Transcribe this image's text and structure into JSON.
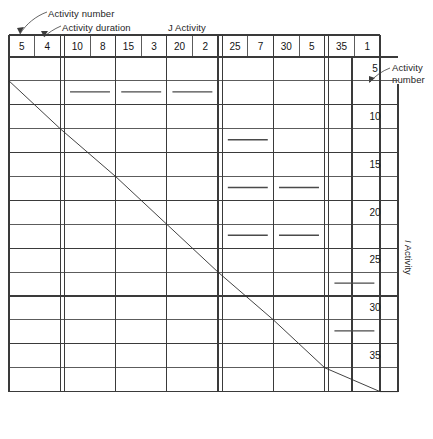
{
  "figure": {
    "type": "precedence-matrix",
    "kind": "activity-on-arrow dependency matrix"
  },
  "annotations": {
    "activity_number_top": "Activity number",
    "activity_duration_top": "Activity duration",
    "j_activity_axis": "J Activity",
    "j_activity_axis_italic": "J",
    "j_activity_axis_rest": " Activity",
    "activity_number_right_line1": "Activity",
    "activity_number_right_line2": "number",
    "i_activity_axis_italic": "I",
    "i_activity_axis_rest": " Activity"
  },
  "columns": {
    "header_label_number": "Activity number",
    "header_label_duration": "Activity duration",
    "items": [
      {
        "number": "5",
        "duration": "4"
      },
      {
        "number": "10",
        "duration": "8"
      },
      {
        "number": "15",
        "duration": "3"
      },
      {
        "number": "20",
        "duration": "2"
      },
      {
        "number": "25",
        "duration": "7"
      },
      {
        "number": "30",
        "duration": "5"
      },
      {
        "number": "35",
        "duration": "1"
      }
    ]
  },
  "rows": {
    "items": [
      {
        "number": "5"
      },
      {
        "number": "10"
      },
      {
        "number": "15"
      },
      {
        "number": "20"
      },
      {
        "number": "25"
      },
      {
        "number": "30"
      },
      {
        "number": "35"
      }
    ]
  },
  "matrix": {
    "mark_glyph": "—",
    "marks": [
      {
        "i": "5",
        "j": "10"
      },
      {
        "i": "5",
        "j": "15"
      },
      {
        "i": "5",
        "j": "20"
      },
      {
        "i": "10",
        "j": "25"
      },
      {
        "i": "15",
        "j": "25"
      },
      {
        "i": "15",
        "j": "30"
      },
      {
        "i": "20",
        "j": "25"
      },
      {
        "i": "20",
        "j": "30"
      },
      {
        "i": "25",
        "j": "35"
      },
      {
        "i": "30",
        "j": "35"
      }
    ]
  },
  "style": {
    "line_color": "#3d3d3d",
    "line_color_light": "#5a5a5a",
    "mark_color": "#444444",
    "page_background": "#ffffff"
  }
}
